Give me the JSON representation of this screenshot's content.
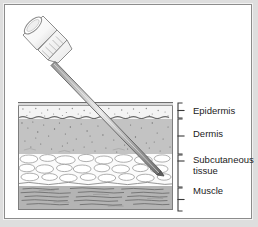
{
  "figure": {
    "background_color": "#dedede",
    "panel_color": "#ffffff",
    "border_color": "#8c8c8c"
  },
  "device": {
    "name": "hypodermic-needle",
    "parts": [
      "hub-barrel",
      "ribbed-collar",
      "tapered-cone",
      "needle-shaft",
      "needle-tip"
    ],
    "angle_degrees": 45,
    "tip_depth_layer": "Subcutaneous tissue",
    "shaft_color": "#6e6e6e",
    "hub_color": "#ffffff"
  },
  "layers": [
    {
      "id": "epidermis",
      "label": "Epidermis",
      "fill": "#f4f4f4",
      "texture": "fine-stipple",
      "thickness_px": 13
    },
    {
      "id": "dermis",
      "label": "Dermis",
      "fill": "#c3c3c3",
      "texture": "dense-speckle",
      "thickness_px": 35
    },
    {
      "id": "subcutaneous",
      "label": "Subcutaneous\ntissue",
      "fill": "#fbfbfb",
      "texture": "fat-lobules",
      "thickness_px": 32
    },
    {
      "id": "muscle",
      "label": "Muscle",
      "fill": "#b4b4b4",
      "texture": "horizontal-fibers",
      "thickness_px": 24
    }
  ],
  "annotation": {
    "bracket_color": "#3a3a3a",
    "text_color": "#1b1b1b"
  }
}
